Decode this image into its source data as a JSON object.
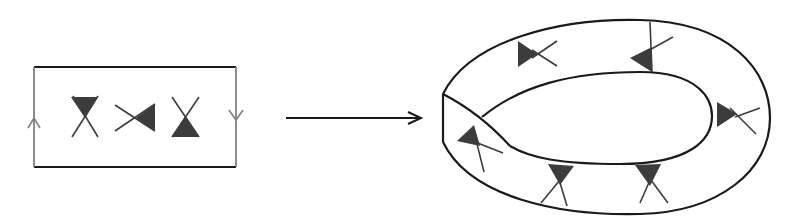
{
  "diagram": {
    "colors": {
      "outline": "#1a1a1a",
      "identified_edge": "#808080",
      "glyph_fill": "#3c3c3c",
      "glyph_line": "#3c3c3c",
      "background": "#ffffff"
    },
    "left_panel": {
      "shape": "rectangle",
      "top_bottom_edges": "solid-dark",
      "left_edge_arrow": "up",
      "right_edge_arrow": "down",
      "glyphs": [
        {
          "type": "bowtie-fill-top",
          "orientation": "vertical"
        },
        {
          "type": "bowtie-fill-right",
          "orientation": "horizontal"
        },
        {
          "type": "bowtie-fill-bottom",
          "orientation": "vertical"
        }
      ]
    },
    "connector": {
      "type": "arrow",
      "direction": "right"
    },
    "right_panel": {
      "shape": "twisted-annulus",
      "glyph_count": 6
    }
  }
}
